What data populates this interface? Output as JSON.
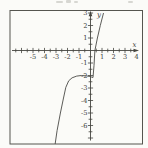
{
  "figure": {
    "background": "#fbfbf8",
    "ink_color": "#45453f",
    "curve_color": "#4a4a46",
    "frame_color": "#55554f",
    "has_frame_box": true
  },
  "chart_data": {
    "type": "line",
    "title": "",
    "xlabel": "x",
    "ylabel": "y",
    "xlim": [
      -6.8,
      4.2
    ],
    "ylim": [
      -7.3,
      3.1
    ],
    "grid": false,
    "minor_tick_step": 0.5,
    "axes_arrows": [
      "x-right",
      "y-top"
    ],
    "x_tick_labels": [
      -5,
      -4,
      -3,
      -2,
      -1,
      1,
      2,
      3,
      4
    ],
    "y_tick_labels": [
      3,
      2,
      1,
      -1,
      -2,
      -3,
      -4,
      -5,
      -6
    ],
    "series": [
      {
        "name": "curve",
        "points": [
          [
            -3.08,
            -7.5
          ],
          [
            -2.9,
            -6.4
          ],
          [
            -2.62,
            -5.0
          ],
          [
            -2.35,
            -3.8
          ],
          [
            -2.15,
            -2.95
          ],
          [
            -1.9,
            -2.42
          ],
          [
            -1.6,
            -2.18
          ],
          [
            -1.2,
            -2.05
          ],
          [
            -0.8,
            -2.0
          ],
          [
            -0.4,
            -2.02
          ],
          [
            -0.05,
            -2.08
          ],
          [
            0.22,
            -2.16
          ],
          [
            0.3,
            -1.2
          ],
          [
            0.38,
            0.0
          ],
          [
            0.6,
            1.0
          ],
          [
            0.85,
            2.0
          ],
          [
            1.13,
            3.0
          ]
        ]
      }
    ]
  }
}
